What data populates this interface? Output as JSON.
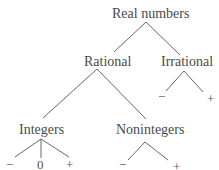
{
  "diagram": {
    "type": "tree",
    "root": {
      "label": "Real numbers",
      "children": [
        {
          "label": "Rational",
          "children": [
            {
              "label": "Integers",
              "children": [
                "−",
                "0",
                "+"
              ]
            },
            {
              "label": "Nonintegers",
              "children": [
                "−",
                "+"
              ]
            }
          ]
        },
        {
          "label": "Irrational",
          "children": [
            "−",
            "+"
          ]
        }
      ]
    }
  },
  "labels": {
    "real": "Real numbers",
    "rational": "Rational",
    "irrational": "Irrational",
    "integers": "Integers",
    "nonintegers": "Nonintegers",
    "minus": "−",
    "zero": "0",
    "plus": "+"
  }
}
